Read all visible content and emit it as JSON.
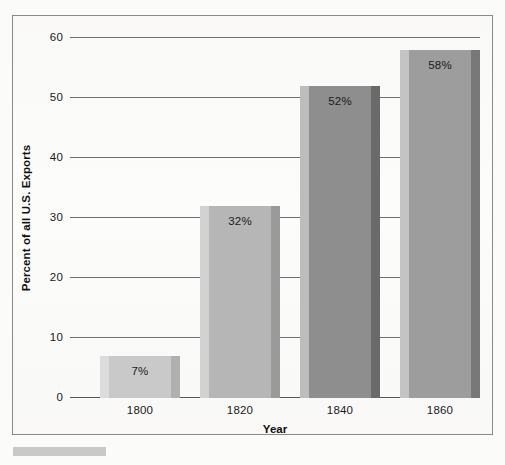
{
  "chart_data": {
    "type": "bar",
    "title": "",
    "xlabel": "Year",
    "ylabel": "Percent of all U.S. Exports",
    "categories": [
      "1800",
      "1820",
      "1840",
      "1860"
    ],
    "values": [
      7,
      32,
      52,
      58
    ],
    "data_labels": [
      "7%",
      "32%",
      "52%",
      "58%"
    ],
    "ylim": [
      0,
      60
    ],
    "yticks": [
      0,
      10,
      20,
      30,
      40,
      50,
      60
    ],
    "ytick_labels": [
      "0",
      "10",
      "20",
      "30",
      "40",
      "50",
      "60"
    ],
    "grid": true,
    "legend": "none",
    "bar_colors": [
      "#c9c9c9",
      "#b6b6b6",
      "#8e8e8e",
      "#9d9d9d"
    ],
    "bar_edge_light": [
      "#dcdcdc",
      "#d2d2d2",
      "#bdbdbd",
      "#c4c4c4"
    ],
    "bar_edge_dark": [
      "#b0b0b0",
      "#9a9a9a",
      "#6a6a6a",
      "#787878"
    ]
  },
  "axes": {
    "y_title": "Percent of all U.S. Exports",
    "x_title": "Year",
    "y_labels": [
      "60",
      "50",
      "40",
      "30",
      "20",
      "10",
      "0"
    ],
    "x_labels": [
      "1800",
      "1820",
      "1840",
      "1860"
    ]
  },
  "bars": [
    {
      "category": "1800",
      "value": 7,
      "label": "7%"
    },
    {
      "category": "1820",
      "value": 32,
      "label": "32%"
    },
    {
      "category": "1840",
      "value": 52,
      "label": "52%"
    },
    {
      "category": "1860",
      "value": 58,
      "label": "58%"
    }
  ],
  "colors": {
    "frame_border": "#8a8a8a",
    "gridline": "#6f6f6f",
    "axis_text": "#1a1a1a",
    "page_background": "#fbfbfa",
    "caption_placeholder": "#c9c9c9"
  }
}
